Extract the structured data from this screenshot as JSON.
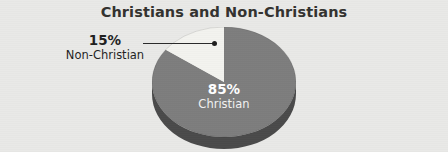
{
  "figure": {
    "background_color": "#e9e9e7",
    "title": "Christians and Non-Christians"
  },
  "labels": {
    "non_christian": {
      "percent": "15%",
      "name": "Non-Christian"
    },
    "christian": {
      "percent": "85%",
      "name": "Christian"
    }
  },
  "chart_data": {
    "type": "pie",
    "title": "Christians and Non-Christians",
    "subtitle": "",
    "xlabel": "",
    "ylabel": "",
    "grid": false,
    "legend": "none",
    "three_d": true,
    "start_angle_deg": 90,
    "direction": "counterclockwise",
    "categories": [
      "Christian",
      "Non-Christian"
    ],
    "values": [
      85,
      15
    ],
    "value_unit": "percent",
    "data_labels": [
      "85%",
      "15%"
    ],
    "slices": [
      {
        "label": "Christian",
        "value": 85,
        "data_label": "85%",
        "color": "#7d7d7d",
        "side_color": "#4a4a4a",
        "label_placement": "inside",
        "label_text_color": "#ffffff"
      },
      {
        "label": "Non-Christian",
        "value": 15,
        "data_label": "15%",
        "color": "#f3f3ef",
        "side_color": "#cfcfc9",
        "label_placement": "outside-leader-line",
        "label_text_color": "#1f1f1f"
      }
    ],
    "annotations": [
      {
        "type": "leader-line",
        "from": "Non-Christian label",
        "to": "Non-Christian slice"
      }
    ]
  }
}
